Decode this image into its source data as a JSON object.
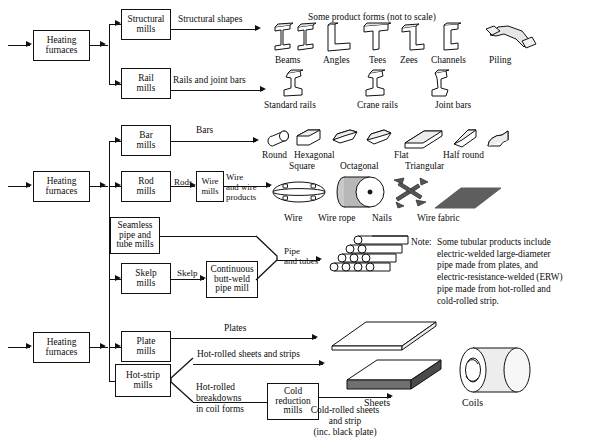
{
  "diagram": {
    "section_heading": "Some product forms (not to scale)",
    "furnaces": [
      {
        "id": "furnace-1",
        "label": "Heating\nfurnaces"
      },
      {
        "id": "furnace-2",
        "label": "Heating\nfurnaces"
      },
      {
        "id": "furnace-3",
        "label": "Heating\nfurnaces"
      }
    ],
    "mills": [
      {
        "id": "structural-mills",
        "label": "Structural\nmills"
      },
      {
        "id": "rail-mills",
        "label": "Rail\nmills"
      },
      {
        "id": "bar-mills",
        "label": "Bar\nmills"
      },
      {
        "id": "rod-mills",
        "label": "Rod\nmills"
      },
      {
        "id": "wire-mills",
        "label": "Wire\nmills"
      },
      {
        "id": "seamless-pipe-tube-mills",
        "label": "Seamless\npipe and\ntube mills"
      },
      {
        "id": "skelp-mills",
        "label": "Skelp\nmills"
      },
      {
        "id": "continuous-butt-weld-pipe-mill",
        "label": "Continuous\nbutt-weld\npipe mill"
      },
      {
        "id": "plate-mills",
        "label": "Plate\nmills"
      },
      {
        "id": "hot-strip-mills",
        "label": "Hot-strip\nmills"
      },
      {
        "id": "cold-reduction-mills",
        "label": "Cold\nreduction\nmills"
      }
    ],
    "flow_labels": {
      "structural_shapes": "Structural shapes",
      "rails_and_joint_bars": "Rails and joint bars",
      "bars": "Bars",
      "rods": "Rods",
      "wire_products": "Wire\nand wire\nproducts",
      "skelp": "Skelp",
      "pipe_and_tubes": "Pipe\nand tubes",
      "plates": "Plates",
      "hot_rolled_sheets_strips": "Hot-rolled sheets and strips",
      "hot_rolled_breakdowns": "Hot-rolled\nbreakdowns\nin coil forms",
      "cold_rolled_sheets": "Cold-rolled sheets\nand strip\n(inc. black plate)"
    },
    "product_groups": [
      {
        "id": "structural-shapes-group",
        "items": [
          "Beams",
          "Angles",
          "Tees",
          "Zees",
          "Channels",
          "Piling"
        ]
      },
      {
        "id": "rail-products-group",
        "items": [
          "Standard rails",
          "Crane rails",
          "Joint bars"
        ]
      },
      {
        "id": "bar-shapes-group-upper",
        "items": [
          "Round",
          "Hexagonal",
          "Flat",
          "Half round"
        ]
      },
      {
        "id": "bar-shapes-group-lower",
        "items": [
          "Square",
          "Octagonal",
          "Triangular"
        ]
      },
      {
        "id": "wire-products-group",
        "items": [
          "Wire",
          "Wire rope",
          "Nails",
          "Wire fabric"
        ]
      },
      {
        "id": "flat-products-group",
        "items": [
          "Sheets",
          "Coils"
        ]
      }
    ],
    "note": {
      "prefix": "Note:",
      "lines": [
        "Some tubular products include",
        "electric-welded large-diameter",
        "pipe made from plates, and",
        "electric-resistance-welded (ERW)",
        "pipe made from hot-rolled and",
        "cold-rolled strip."
      ]
    },
    "colors": {
      "line": "#111111",
      "background": "#ffffff",
      "fill_dark": "#6d6d6d"
    }
  }
}
